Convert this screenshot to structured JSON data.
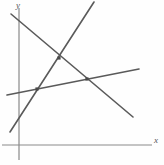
{
  "figure": {
    "width": 164,
    "height": 165,
    "background_color": "#fefefe"
  },
  "axes": {
    "x_axis": {
      "label": "x",
      "color": "#8a8a8a",
      "y_position": 145,
      "x_start": 2,
      "x_end": 152,
      "stroke_width": 1.1
    },
    "y_axis": {
      "label": "y",
      "color": "#9a9a9a",
      "x_position": 19,
      "y_start": 8,
      "y_end": 160,
      "stroke_width": 1.4
    }
  },
  "chart_data": {
    "type": "line",
    "xlabel": "x",
    "ylabel": "y",
    "grid": false,
    "legend": "none",
    "line_color": "#5a5a5a",
    "series": [
      {
        "name": "descending-line",
        "description": "Steeply descending line from upper-left to lower-right",
        "x": [
          11,
          133
        ],
        "y": [
          14,
          117
        ]
      },
      {
        "name": "ascending-steep-line",
        "description": "Steeply ascending line from lower-left to upper-right",
        "x": [
          10,
          94
        ],
        "y": [
          132,
          2
        ]
      },
      {
        "name": "ascending-shallow-line",
        "description": "Gently ascending line from left edge to right edge",
        "x": [
          7,
          139
        ],
        "y": [
          95,
          69
        ]
      }
    ],
    "intersections": [
      {
        "name": "top-intersection",
        "x": 59,
        "y": 58
      },
      {
        "name": "left-intersection",
        "x": 37,
        "y": 89
      },
      {
        "name": "right-intersection",
        "x": 87,
        "y": 79
      }
    ],
    "point_color": "#4a4a4a",
    "point_size": 3.2
  }
}
